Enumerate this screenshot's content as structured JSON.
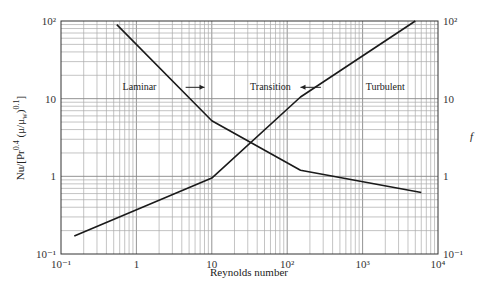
{
  "chart_data": {
    "type": "line",
    "title": "",
    "xlabel": "Reynolds number",
    "ylabel": "Nu/[Pr^0.4 (μ/μw)^0.1]",
    "ylabel_right": "f",
    "x_scale": "log",
    "y_scale": "log",
    "xlim": [
      0.1,
      10000
    ],
    "ylim": [
      0.1,
      100
    ],
    "grid": true,
    "x_ticks": [
      "10⁻¹",
      "1",
      "10",
      "10²",
      "10³",
      "10⁴"
    ],
    "y_ticks_left": [
      "10²",
      "10",
      "1",
      "10⁻¹"
    ],
    "y_ticks_right": [
      "10²",
      "10",
      "1",
      "10⁻¹"
    ],
    "series": [
      {
        "name": "Nu/[Pr^0.4 (μ/μw)^0.1]",
        "x": [
          0.15,
          10,
          150,
          5000
        ],
        "y": [
          0.17,
          0.95,
          10.5,
          100
        ]
      },
      {
        "name": "f",
        "x": [
          0.55,
          10,
          150,
          6000
        ],
        "y": [
          90,
          5.2,
          1.2,
          0.62
        ]
      }
    ],
    "annotations": [
      {
        "text": "Laminar",
        "x": 1.1,
        "y": 13
      },
      {
        "text": "Transition",
        "x": 60,
        "y": 13
      },
      {
        "text": "Turbulent",
        "x": 2000,
        "y": 13
      }
    ],
    "arrows": [
      {
        "direction": "right",
        "from_x": 4.5,
        "to_x": 8,
        "y": 14
      },
      {
        "direction": "left",
        "from_x": 280,
        "to_x": 150,
        "y": 14
      }
    ]
  }
}
